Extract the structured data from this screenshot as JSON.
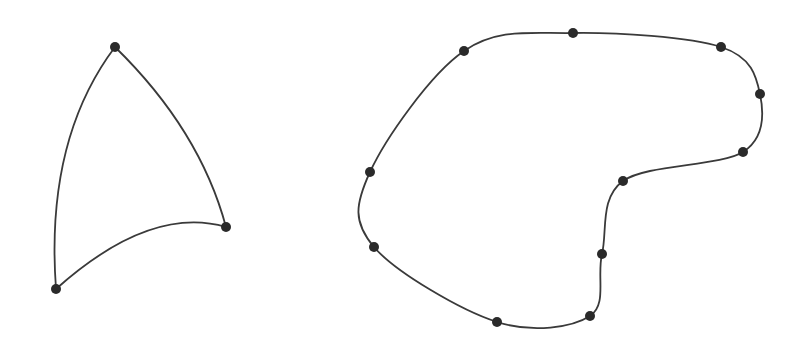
{
  "diagram": {
    "background": "#ffffff",
    "stroke_color": "#3a3a3a",
    "point_color": "#2a2a2a",
    "shapes": [
      {
        "name": "triangle-spline",
        "closed": true,
        "points": [
          [
            115,
            47
          ],
          [
            226,
            227
          ],
          [
            56,
            289
          ]
        ],
        "paths": [
          "M115,47 Q200,130 226,227",
          "M226,227 Q150,205 56,289",
          "M56,289 Q45,140 115,47"
        ]
      },
      {
        "name": "blob-spline",
        "closed": true,
        "points": [
          [
            464,
            51
          ],
          [
            573,
            33
          ],
          [
            721,
            47
          ],
          [
            760,
            94
          ],
          [
            743,
            152
          ],
          [
            623,
            181
          ],
          [
            602,
            254
          ],
          [
            590,
            316
          ],
          [
            497,
            322
          ],
          [
            374,
            247
          ],
          [
            370,
            172
          ]
        ]
      }
    ]
  }
}
